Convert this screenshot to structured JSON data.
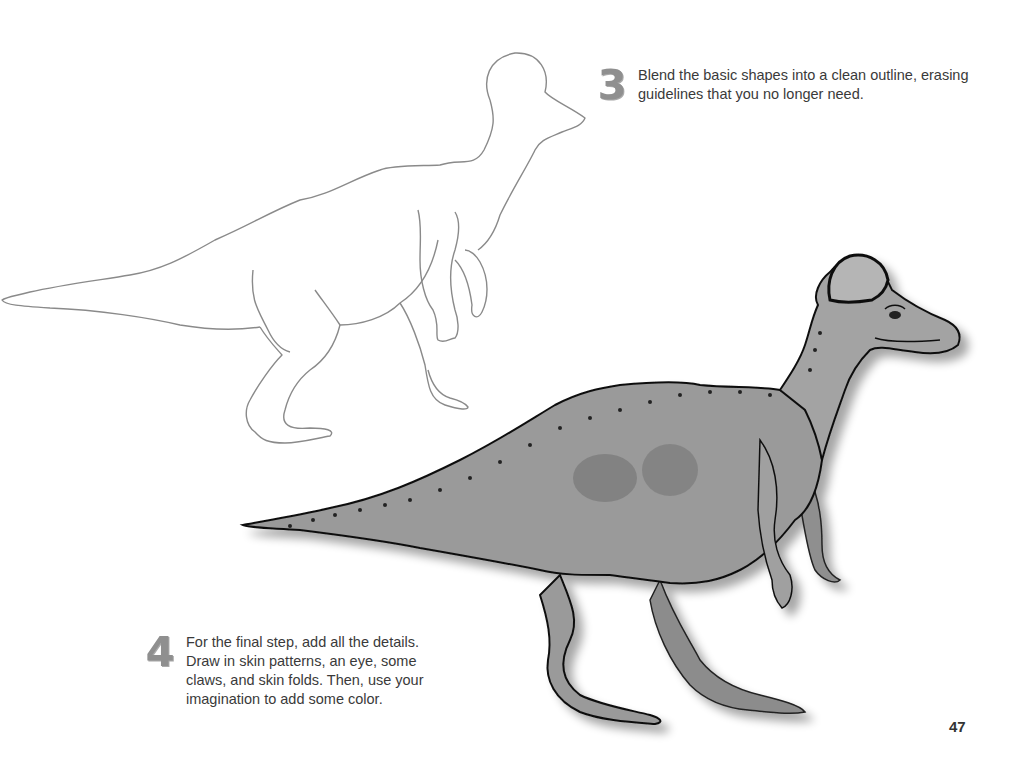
{
  "page": {
    "number": "47"
  },
  "steps": [
    {
      "number": "3",
      "text": "Blend the basic shapes into a clean outline, erasing guidelines that you no longer need."
    },
    {
      "number": "4",
      "text": "For the final step, add all the details. Draw in skin patterns, an eye, some claws, and skin folds. Then, use your imagination to add some color."
    }
  ],
  "illustrations": {
    "outline": "dinosaur-outline-drawing",
    "final": "dinosaur-shaded-drawing"
  },
  "colors": {
    "outline_stroke": "#8a8a8a",
    "body_fill": "#9a9a9a",
    "body_dark": "#7a7a7a",
    "crest_fill": "#b5b5b5",
    "step_number": "#8f8f8f"
  }
}
